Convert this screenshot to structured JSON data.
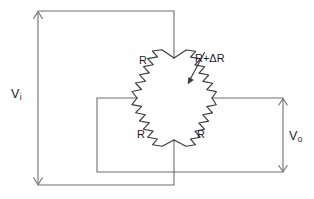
{
  "diagram": {
    "type": "wheatstone-bridge-circuit",
    "labels": {
      "input_voltage": "V",
      "input_voltage_sub": "i",
      "output_voltage": "V",
      "output_voltage_sub": "o",
      "resistor_top_left": "R",
      "resistor_top_right": "R+ΔR",
      "resistor_bottom_left": "R",
      "resistor_bottom_right": "R"
    },
    "colors": {
      "background": "#ffffff",
      "wire": "#6e6e6e",
      "component": "#3a3a3a",
      "text": "#1d1d1d"
    },
    "nodes": {
      "bridge_top": "174,58",
      "bridge_left": "137,98",
      "bridge_right": "212,98",
      "bridge_bottom": "174,140"
    }
  }
}
